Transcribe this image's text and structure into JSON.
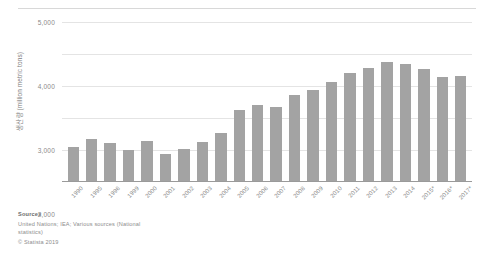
{
  "chart_data": {
    "type": "bar",
    "title": "",
    "xlabel": "",
    "ylabel": "생산량 (million metric tons)",
    "ylim": [
      0,
      5000
    ],
    "yticks": [
      0,
      1000,
      2000,
      3000,
      4000,
      5000
    ],
    "ytick_labels": [
      "0",
      "1,000",
      "2,000",
      "3,000",
      "4,000",
      "5,000"
    ],
    "grid": true,
    "legend": "none",
    "bar_color": "#a3a3a3",
    "categories": [
      "1990",
      "1995",
      "1996",
      "1999",
      "2000",
      "2001",
      "2002",
      "2003",
      "2004",
      "2005",
      "2006",
      "2007",
      "2008",
      "2009",
      "2010",
      "2011",
      "2012",
      "2013",
      "2014",
      "2015*",
      "2016*",
      "2017*"
    ],
    "values": [
      1100,
      1350,
      1220,
      1010,
      1290,
      880,
      1030,
      1240,
      1540,
      2250,
      2400,
      2330,
      2720,
      2870,
      3130,
      3400,
      3550,
      3750,
      3680,
      3540,
      3280,
      3320
    ]
  },
  "axis": {
    "y_title": "생산량 (million metric tons)"
  },
  "sources": {
    "heading": "Sources",
    "line1": "United Nations; IEA; Various sources (National",
    "line2": "statistics)",
    "copyright": "© Statista 2019"
  }
}
